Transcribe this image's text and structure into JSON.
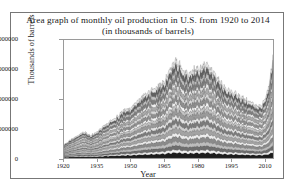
{
  "figure": {
    "title_line1": "Area graph of monthly oil production in U.S. from 1920 to 2014",
    "title_line2": "(in thousands of barrels)"
  },
  "chart_data": {
    "type": "area",
    "title": "Area graph of monthly oil production in U.S. from 1920 to 2014 (in thousands of barrels)",
    "xlabel": "Year",
    "ylabel": "Thousands of barrels",
    "xlim": [
      1920,
      2014
    ],
    "ylim": [
      0,
      4000000
    ],
    "xticks": [
      1920,
      1935,
      1950,
      1965,
      1980,
      1995,
      2010
    ],
    "xticklabels": [
      "1920",
      "1935",
      "1950",
      "1965",
      "1980",
      "1995",
      "2010"
    ],
    "yticks": [
      0,
      1000000,
      2000000,
      3000000,
      4000000
    ],
    "yticklabels": [
      "0",
      "1000000",
      "2000000",
      "3000000",
      "4000000"
    ],
    "grid": false,
    "legend": "none",
    "stacked": true,
    "x": [
      1920,
      1923,
      1926,
      1929,
      1932,
      1935,
      1938,
      1941,
      1944,
      1947,
      1950,
      1953,
      1956,
      1959,
      1962,
      1965,
      1968,
      1970,
      1972,
      1974,
      1976,
      1978,
      1980,
      1982,
      1984,
      1986,
      1988,
      1990,
      1992,
      1994,
      1996,
      1998,
      2000,
      2002,
      2004,
      2006,
      2008,
      2010,
      2012,
      2014
    ],
    "total_values": [
      450000,
      620000,
      760000,
      900000,
      760000,
      900000,
      1080000,
      1250000,
      1400000,
      1620000,
      1700000,
      1900000,
      2150000,
      2250000,
      2400000,
      2600000,
      3000000,
      3300000,
      3150000,
      2950000,
      2800000,
      2980000,
      3050000,
      3080000,
      3150000,
      3050000,
      2800000,
      2600000,
      2450000,
      2300000,
      2250000,
      2150000,
      2050000,
      1980000,
      1880000,
      1800000,
      1750000,
      1900000,
      2400000,
      3400000
    ],
    "series": [
      {
        "name": "band-01",
        "color": "#1c1c1c",
        "share": 0.055
      },
      {
        "name": "band-02",
        "color": "#f2f2f2",
        "share": 0.03
      },
      {
        "name": "band-03",
        "color": "#6e6e6e",
        "share": 0.045
      },
      {
        "name": "band-04",
        "color": "#bdbdbd",
        "share": 0.04
      },
      {
        "name": "band-05",
        "color": "#8a8a8a",
        "share": 0.05
      },
      {
        "name": "band-06",
        "color": "#ededed",
        "share": 0.038
      },
      {
        "name": "band-07",
        "color": "#a3a3a3",
        "share": 0.052
      },
      {
        "name": "band-08",
        "color": "#cfcfcf",
        "share": 0.04
      },
      {
        "name": "band-09",
        "color": "#7b7b7b",
        "share": 0.048
      },
      {
        "name": "band-10",
        "color": "#e4e4e4",
        "share": 0.042
      },
      {
        "name": "band-11",
        "color": "#9a9a9a",
        "share": 0.055
      },
      {
        "name": "band-12",
        "color": "#c6c6c6",
        "share": 0.045
      },
      {
        "name": "band-13",
        "color": "#f7f7f7",
        "share": 0.04
      },
      {
        "name": "band-14",
        "color": "#8f8f8f",
        "share": 0.052
      },
      {
        "name": "band-15",
        "color": "#d8d8d8",
        "share": 0.048
      },
      {
        "name": "band-16",
        "color": "#ababab",
        "share": 0.055
      },
      {
        "name": "band-17",
        "color": "#efefef",
        "share": 0.045
      },
      {
        "name": "band-18",
        "color": "#7f7f7f",
        "share": 0.058
      },
      {
        "name": "band-19",
        "color": "#c2c2c2",
        "share": 0.05
      },
      {
        "name": "band-20",
        "color": "#616161",
        "share": 0.062
      },
      {
        "name": "band-21",
        "color": "#e9e9e9",
        "share": 0.05
      }
    ]
  }
}
